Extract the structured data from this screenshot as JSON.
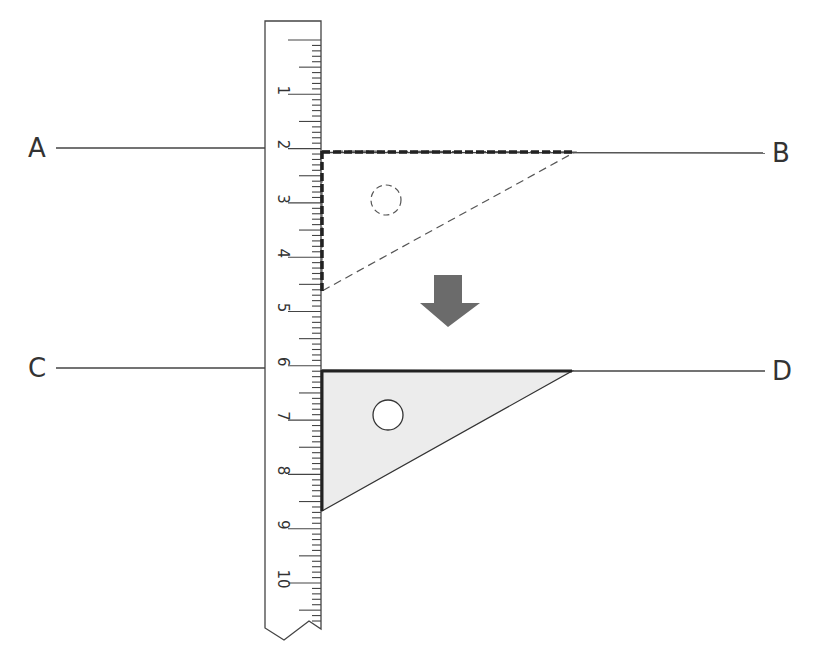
{
  "diagram": {
    "labels": {
      "a": "A",
      "b": "B",
      "c": "C",
      "d": "D"
    },
    "ruler": {
      "numbers": [
        "1",
        "2",
        "3",
        "4",
        "5",
        "6",
        "7",
        "8",
        "9",
        "10"
      ],
      "unit": "cm"
    },
    "set_square_before": {
      "style": "dashed",
      "position": "line AB"
    },
    "set_square_after": {
      "style": "solid-filled",
      "position": "line CD"
    },
    "arrow": {
      "direction": "down",
      "meaning": "slide set square along ruler"
    },
    "colors": {
      "line": "#333333",
      "arrow": "#6b6b6b",
      "set_square_fill": "#ececec",
      "ruler_fill": "#ffffff"
    }
  }
}
